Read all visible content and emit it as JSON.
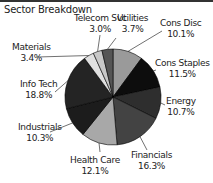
{
  "chart_data": {
    "type": "pie",
    "title": "Sector Breakdown",
    "categories": [
      "Cons Disc",
      "Cons Staples",
      "Energy",
      "Financials",
      "Health Care",
      "Industrials",
      "Info Tech",
      "Materials",
      "Telecom Svc",
      "Utilities"
    ],
    "values": [
      10.1,
      11.5,
      10.7,
      16.3,
      12.1,
      10.3,
      18.8,
      3.4,
      3.0,
      3.7
    ],
    "labels": [
      "10.1%",
      "11.5%",
      "10.7%",
      "16.3%",
      "12.1%",
      "10.3%",
      "18.8%",
      "3.4%",
      "3.0%",
      "3.7%"
    ],
    "colors": [
      "#9a9a9a",
      "#0d0d0d",
      "#2e2e2e",
      "#434343",
      "#a8a8a8",
      "#1c1c1c",
      "#242424",
      "#e0e0e0",
      "#c8c8c8",
      "#555555"
    ],
    "start": "12 o'clock, clockwise",
    "legend": "none (callout labels)"
  },
  "labels": {
    "cons_disc": {
      "name": "Cons Disc",
      "pct": "10.1%"
    },
    "cons_staples": {
      "name": "Cons Staples",
      "pct": "11.5%"
    },
    "energy": {
      "name": "Energy",
      "pct": "10.7%"
    },
    "financials": {
      "name": "Financials",
      "pct": "16.3%"
    },
    "health_care": {
      "name": "Health Care",
      "pct": "12.1%"
    },
    "industrials": {
      "name": "Industrials",
      "pct": "10.3%"
    },
    "info_tech": {
      "name": "Info Tech",
      "pct": "18.8%"
    },
    "materials": {
      "name": "Materials",
      "pct": "3.4%"
    },
    "telecom": {
      "name": "Telecom Svc",
      "pct": "3.0%"
    },
    "utilities": {
      "name": "Utilities",
      "pct": "3.7%"
    }
  }
}
